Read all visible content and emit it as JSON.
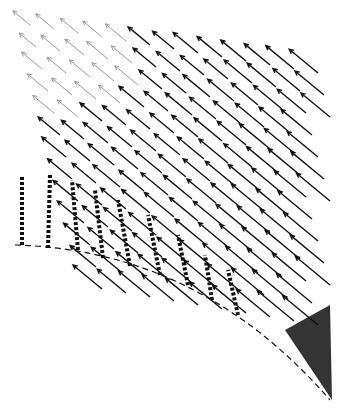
{
  "figure": {
    "type": "vector-field",
    "colors": {
      "background": "#ffffff",
      "ink": "#111111",
      "faint_ink": "#9a9a9a"
    },
    "wall": {
      "center": [
        20,
        500
      ],
      "radius": 250,
      "start_deg": -90,
      "end_deg": -20
    },
    "flow_direction": "up-left",
    "rays": 14,
    "rings": 13
  }
}
